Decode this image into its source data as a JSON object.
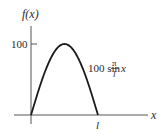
{
  "chart_data": {
    "type": "line",
    "title": "",
    "ylabel": "f(x)",
    "xlabel": "x",
    "x_ticks": [
      {
        "value": 1,
        "label": "l"
      }
    ],
    "y_ticks": [
      {
        "value": 100,
        "label": "100"
      }
    ],
    "xlim": [
      0,
      1.6
    ],
    "ylim": [
      0,
      135
    ],
    "grid": false,
    "series": [
      {
        "name": "100 sin (π/l) x",
        "function": "100*sin(pi*x/l)",
        "domain": [
          0,
          1
        ],
        "peak": {
          "x": 0.5,
          "y": 100
        }
      }
    ],
    "annotation": {
      "prefix": "100 sin",
      "frac_num": "π",
      "frac_den": "l",
      "suffix": "x"
    }
  },
  "colors": {
    "curve": "#1a1a1a",
    "axis": "#555555",
    "text": "#2a2a2a"
  }
}
